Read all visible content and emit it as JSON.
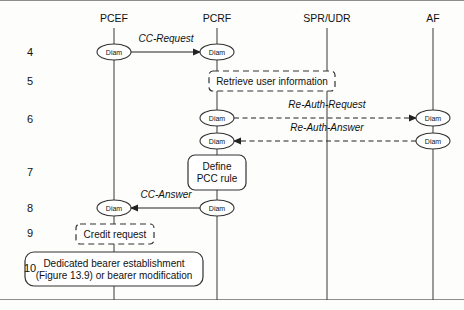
{
  "figure": {
    "type": "sequence-diagram",
    "background_color": "#fdfdfc",
    "line_color": "#333333"
  },
  "lifelines": [
    {
      "id": "pcef",
      "label": "PCEF",
      "x": 114,
      "top": 28,
      "bottom": 300
    },
    {
      "id": "pcrf",
      "label": "PCRF",
      "x": 217,
      "top": 28,
      "bottom": 300
    },
    {
      "id": "spr_udr",
      "label": "SPR/UDR",
      "x": 327,
      "top": 28,
      "bottom": 300
    },
    {
      "id": "af",
      "label": "AF",
      "x": 433,
      "top": 28,
      "bottom": 300
    }
  ],
  "steps": [
    {
      "number": "4",
      "y": 52
    },
    {
      "number": "5",
      "y": 81
    },
    {
      "number": "6",
      "y": 119
    },
    {
      "number": "7",
      "y": 172
    },
    {
      "number": "8",
      "y": 208
    },
    {
      "number": "9",
      "y": 233
    },
    {
      "number": "10",
      "y": 268
    }
  ],
  "messages": [
    {
      "id": "cc-request",
      "label": "CC-Request",
      "from": "pcef",
      "to": "pcrf",
      "style": "solid",
      "direction": "right",
      "y": 52,
      "label_x": 166,
      "label_y": 42
    },
    {
      "id": "re-auth-request",
      "label": "Re-Auth-Request",
      "from": "pcrf",
      "to": "af",
      "style": "dashed",
      "direction": "right",
      "y": 118,
      "label_x": 327,
      "label_y": 108
    },
    {
      "id": "re-auth-answer",
      "label": "Re-Auth-Answer",
      "from": "af",
      "to": "pcrf",
      "style": "dashed",
      "direction": "left",
      "y": 141,
      "label_x": 327,
      "label_y": 131
    },
    {
      "id": "cc-answer",
      "label": "CC-Answer",
      "from": "pcrf",
      "to": "pcef",
      "style": "solid",
      "direction": "left",
      "y": 208,
      "label_x": 166,
      "label_y": 198
    }
  ],
  "diam_nodes": [
    {
      "id": "diam-pcef-4",
      "label": "Diam",
      "x": 114,
      "y": 52
    },
    {
      "id": "diam-pcrf-4",
      "label": "Diam",
      "x": 217,
      "y": 52
    },
    {
      "id": "diam-pcrf-6a",
      "label": "Diam",
      "x": 217,
      "y": 118
    },
    {
      "id": "diam-af-6a",
      "label": "Diam",
      "x": 433,
      "y": 118
    },
    {
      "id": "diam-pcrf-6b",
      "label": "Diam",
      "x": 217,
      "y": 141
    },
    {
      "id": "diam-af-6b",
      "label": "Diam",
      "x": 433,
      "y": 141
    },
    {
      "id": "diam-pcrf-8",
      "label": "Diam",
      "x": 217,
      "y": 208
    },
    {
      "id": "diam-pcef-8",
      "label": "Diam",
      "x": 114,
      "y": 208
    }
  ],
  "boxes": [
    {
      "id": "retrieve-user-information",
      "style": "dashed",
      "lines": [
        "Retrieve user information"
      ],
      "x": 209,
      "y": 71,
      "width": 126,
      "height": 20,
      "rx": 4
    },
    {
      "id": "define-pcc-rule",
      "style": "solid",
      "lines": [
        "Define",
        "PCC rule"
      ],
      "x": 188,
      "y": 155,
      "width": 58,
      "height": 35,
      "rx": 7
    },
    {
      "id": "credit-request",
      "style": "dashed",
      "lines": [
        "Credit request"
      ],
      "x": 76,
      "y": 224,
      "width": 78,
      "height": 20,
      "rx": 4
    },
    {
      "id": "dedicated-bearer-establishment",
      "style": "solid",
      "lines": [
        "Dedicated bearer establishment",
        "(Figure 13.9) or bearer modification"
      ],
      "x": 25,
      "y": 252,
      "width": 178,
      "height": 34,
      "rx": 9
    }
  ]
}
